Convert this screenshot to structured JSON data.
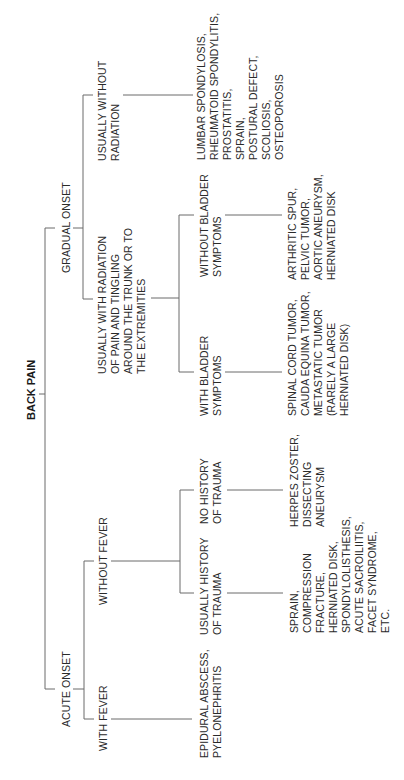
{
  "diagram": {
    "title": "BACK PAIN",
    "orientation": "rotated-90-ccw",
    "line_color": "#6a6a6a",
    "text_color": "#2a2a2a",
    "branches": {
      "gradual_onset": {
        "label": "GRADUAL ONSET",
        "without_radiation": {
          "label": [
            "USUALLY WITHOUT",
            "RADIATION"
          ],
          "diagnoses": [
            "LUMBAR SPONDYLOSIS,",
            "RHEUMATOID SPONDYLITIS,",
            "PROSTATITIS,",
            "SPRAIN,",
            "POSTURAL DEFECT,",
            "SCOLIOSIS,",
            "OSTEOPOROSIS"
          ]
        },
        "with_radiation": {
          "label": [
            "USUALLY WITH RADIATION",
            "OF PAIN AND TINGLING",
            "AROUND THE TRUNK OR TO",
            "THE EXTREMITIES"
          ],
          "without_bladder": {
            "label": [
              "WITHOUT BLADDER",
              "SYMPTOMS"
            ],
            "diagnoses": [
              "ARTHRITIC SPUR,",
              "PELVIC TUMOR,",
              "AORTIC ANEURYSM,",
              "HERNIATED DISK"
            ]
          },
          "with_bladder": {
            "label": [
              "WITH BLADDER",
              "SYMPTOMS"
            ],
            "diagnoses": [
              "SPINAL CORD TUMOR,",
              "CAUDA EQUINA TUMOR,",
              "METASTATIC TUMOR",
              "(RARELY A LARGE",
              "HERNIATED DISK)"
            ]
          }
        }
      },
      "acute_onset": {
        "label": "ACUTE ONSET",
        "without_fever": {
          "label": "WITHOUT FEVER",
          "no_trauma": {
            "label": [
              "NO HISTORY",
              "OF TRAUMA"
            ],
            "diagnoses": [
              "HERPES ZOSTER,",
              "DISSECTING",
              "ANEURYSM"
            ]
          },
          "trauma": {
            "label": [
              "USUALLY HISTORY",
              "OF TRAUMA"
            ],
            "diagnoses": [
              "SPRAIN,",
              "COMPRESSION",
              "FRACTURE,",
              "HERNIATED DISK,",
              "SPONDYLOLISTHESIS,",
              "ACUTE SACROILIITIS,",
              "FACET SYNDROME,",
              "ETC."
            ]
          }
        },
        "with_fever": {
          "label": "WITH FEVER",
          "diagnoses": [
            "EPIDURAL ABSCESS,",
            "PYELONEPHRITIS"
          ]
        }
      }
    }
  }
}
